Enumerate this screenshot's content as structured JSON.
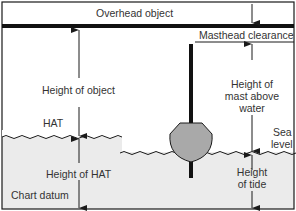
{
  "diagram": {
    "labels": {
      "overhead_object": "Overhead object",
      "masthead_clearance": "Masthead clearance",
      "height_of_object": "Height of object",
      "hat": "HAT",
      "height_of_mast_line1": "Height of",
      "height_of_mast_line2": "mast above",
      "height_of_mast_line3": "water",
      "sea_level_line1": "Sea",
      "sea_level_line2": "level",
      "height_of_hat": "Height of HAT",
      "chart_datum": "Chart datum",
      "height_of_tide_line1": "Height",
      "height_of_tide_line2": "of tide"
    },
    "colors": {
      "line": "#1a1a1a",
      "water": "#ebebeb",
      "hull": "#a9a9a9",
      "text": "#333333"
    }
  }
}
